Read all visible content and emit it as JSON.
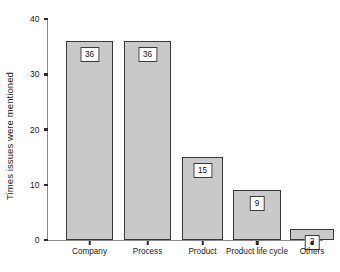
{
  "chart_data": {
    "type": "bar",
    "title": "",
    "xlabel": "",
    "ylabel": "Times issues were mentioned",
    "categories": [
      "Company",
      "Process",
      "Product",
      "Product life cycle",
      "Others"
    ],
    "values": [
      36,
      36,
      15,
      9,
      2
    ],
    "data_labels": [
      "36",
      "36",
      "15",
      "9",
      "2"
    ],
    "ylim": [
      0,
      40
    ],
    "yticks": [
      0,
      10,
      20,
      30,
      40
    ],
    "ytick_labels": [
      "0",
      "10",
      "20",
      "30",
      "40"
    ],
    "grid": false,
    "legend": null,
    "legend_position": "none",
    "bar_fill_color": "#c9c9c9",
    "bar_edge_color": "#3a3a3a",
    "axis_color": "#8a8a8a",
    "label_box_fill": "#ffffff",
    "background_color": "#ffffff",
    "text_color": "#1a1a1a"
  }
}
